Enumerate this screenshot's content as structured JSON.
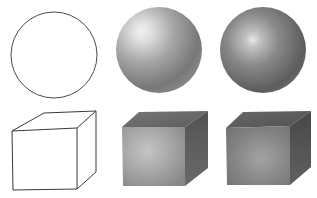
{
  "figure": {
    "background": "#ffffff",
    "line_color": "#3a3a3a",
    "rows": [
      {
        "shape": "sphere",
        "items": [
          {
            "style": "outline",
            "cx": 54,
            "cy": 55,
            "r": 43
          },
          {
            "style": "shaded-light",
            "cx": 159,
            "cy": 50,
            "r": 43,
            "highlight": [
              145,
              37
            ],
            "light": "#f4f4f4",
            "mid": "#a8a8a8",
            "dark": "#5e5e5e"
          },
          {
            "style": "shaded-dark",
            "cx": 263,
            "cy": 50,
            "r": 43,
            "highlight": [
              253,
              40
            ],
            "light": "#e6e6e6",
            "mid": "#8a8a8a",
            "dark": "#4a4a4a"
          }
        ]
      },
      {
        "shape": "cube",
        "items": [
          {
            "style": "outline"
          },
          {
            "style": "shaded-light",
            "front": "#9c9c9c",
            "top": "#6e6e6e",
            "side": "#5a5a5a"
          },
          {
            "style": "shaded-dark",
            "front": "#858585",
            "top": "#5f5f5f",
            "side": "#4e4e4e"
          }
        ]
      }
    ]
  }
}
